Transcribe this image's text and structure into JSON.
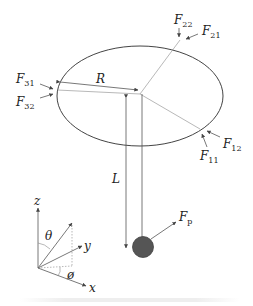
{
  "diagram": {
    "labels": {
      "F22": {
        "base": "F",
        "sub": "22"
      },
      "F21": {
        "base": "F",
        "sub": "21"
      },
      "F31": {
        "base": "F",
        "sub": "31"
      },
      "F32": {
        "base": "F",
        "sub": "32"
      },
      "F11": {
        "base": "F",
        "sub": "11"
      },
      "F12": {
        "base": "F",
        "sub": "12"
      },
      "Fp": {
        "base": "F",
        "sub": "p"
      },
      "R": "R",
      "L": "L",
      "z": "z",
      "y": "y",
      "x": "x",
      "theta": "θ",
      "phi": "ø"
    },
    "colors": {
      "line": "#555555",
      "ball": "#555555",
      "text": "#222222"
    }
  }
}
